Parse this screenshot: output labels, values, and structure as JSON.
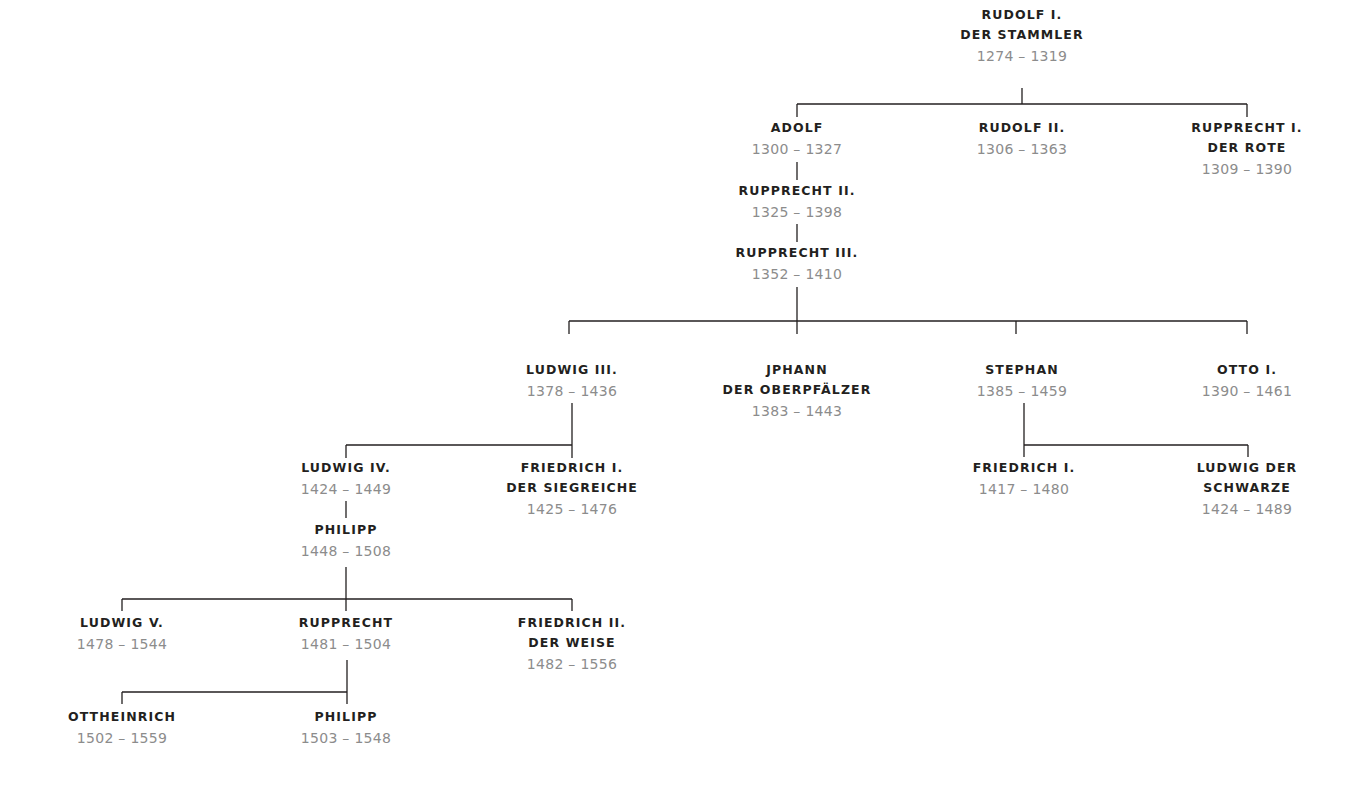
{
  "diagram": {
    "type": "family-tree",
    "line_color": "#231f20",
    "name_color": "#231f20",
    "years_color": "#8c8c8c",
    "nodes": [
      {
        "id": "rudolf1",
        "name": [
          "RUDOLF I.",
          "DER STAMMLER"
        ],
        "years": "1274 – 1319",
        "x": 1022,
        "y": 5
      },
      {
        "id": "adolf",
        "name": [
          "ADOLF"
        ],
        "years": "1300 – 1327",
        "x": 797,
        "y": 118,
        "parent": "rudolf1"
      },
      {
        "id": "rudolf2",
        "name": [
          "RUDOLF II."
        ],
        "years": "1306 – 1363",
        "x": 1022,
        "y": 118,
        "parent": "rudolf1"
      },
      {
        "id": "rupprecht1",
        "name": [
          "RUPPRECHT I.",
          "DER ROTE"
        ],
        "years": "1309 – 1390",
        "x": 1247,
        "y": 118,
        "parent": "rudolf1"
      },
      {
        "id": "rupprecht2",
        "name": [
          "RUPPRECHT II."
        ],
        "years": "1325 – 1398",
        "x": 797,
        "y": 181,
        "parent": "adolf"
      },
      {
        "id": "rupprecht3",
        "name": [
          "RUPPRECHT III."
        ],
        "years": "1352 – 1410",
        "x": 797,
        "y": 243,
        "parent": "rupprecht2"
      },
      {
        "id": "ludwig3",
        "name": [
          "LUDWIG III."
        ],
        "years": "1378 – 1436",
        "x": 572,
        "y": 360,
        "parent": "rupprecht3"
      },
      {
        "id": "johann",
        "name": [
          "JPHANN",
          "DER OBERPFÄLZER"
        ],
        "years": "1383 – 1443",
        "x": 797,
        "y": 360,
        "parent": "rupprecht3"
      },
      {
        "id": "stephan",
        "name": [
          "STEPHAN"
        ],
        "years": "1385 – 1459",
        "x": 1022,
        "y": 360,
        "parent": "rupprecht3"
      },
      {
        "id": "otto1",
        "name": [
          "OTTO I."
        ],
        "years": "1390 – 1461",
        "x": 1247,
        "y": 360,
        "parent": "rupprecht3"
      },
      {
        "id": "ludwig4",
        "name": [
          "LUDWIG IV."
        ],
        "years": "1424 – 1449",
        "x": 346,
        "y": 458,
        "parent": "ludwig3"
      },
      {
        "id": "friedrich1s",
        "name": [
          "FRIEDRICH I.",
          "DER SIEGREICHE"
        ],
        "years": "1425 – 1476",
        "x": 572,
        "y": 458,
        "parent": "ludwig3"
      },
      {
        "id": "friedrich1",
        "name": [
          "FRIEDRICH I."
        ],
        "years": "1417 – 1480",
        "x": 1024,
        "y": 458,
        "parent": "stephan"
      },
      {
        "id": "ludwigschwarze",
        "name": [
          "LUDWIG DER",
          "SCHWARZE"
        ],
        "years": "1424 – 1489",
        "x": 1247,
        "y": 458,
        "parent": "stephan"
      },
      {
        "id": "philipp1",
        "name": [
          "PHILIPP"
        ],
        "years": "1448 – 1508",
        "x": 346,
        "y": 520,
        "parent": "ludwig4"
      },
      {
        "id": "ludwig5",
        "name": [
          "LUDWIG V."
        ],
        "years": "1478 – 1544",
        "x": 122,
        "y": 613,
        "parent": "philipp1"
      },
      {
        "id": "rupprecht",
        "name": [
          "RUPPRECHT"
        ],
        "years": "1481 – 1504",
        "x": 346,
        "y": 613,
        "parent": "philipp1"
      },
      {
        "id": "friedrich2",
        "name": [
          "FRIEDRICH II.",
          "DER WEISE"
        ],
        "years": "1482 – 1556",
        "x": 572,
        "y": 613,
        "parent": "philipp1"
      },
      {
        "id": "ottheinrich",
        "name": [
          "OTTHEINRICH"
        ],
        "years": "1502 – 1559",
        "x": 122,
        "y": 707,
        "parent": "rupprecht"
      },
      {
        "id": "philipp2",
        "name": [
          "PHILIPP"
        ],
        "years": "1503 – 1548",
        "x": 346,
        "y": 707,
        "parent": "rupprecht"
      }
    ]
  }
}
